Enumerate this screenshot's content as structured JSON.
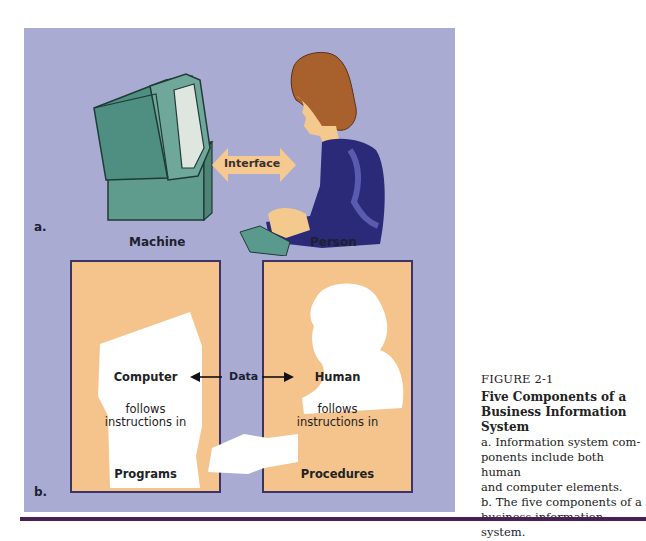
{
  "figure": {
    "number": "FIGURE 2-1",
    "title": "Five Components of a Business Information System",
    "caption_a": "a. Information system components include both human and computer elements.",
    "caption_b": "b. The five components of a business information system.",
    "caption_lines": [
      "a. Information system com-",
      "ponents include both human",
      "and computer elements.",
      "b. The five components of a",
      "business information system."
    ]
  },
  "part_a": {
    "label": "a.",
    "interface_label": "Interface",
    "machine_label": "Machine",
    "person_label": "Person"
  },
  "part_b": {
    "label": "b.",
    "data_label": "Data",
    "left_box": {
      "heading": "Computer",
      "line1": "follows",
      "line2": "instructions in",
      "footer": "Programs"
    },
    "right_box": {
      "heading": "Human",
      "line1": "follows",
      "line2": "instructions in",
      "footer": "Procedures"
    }
  },
  "colors": {
    "panel_bg": "#a9abd2",
    "box_fill": "#f4c48c",
    "box_border": "#3d3466",
    "rule": "#4a1f55",
    "computer_green": "#4f8f82",
    "sweater": "#2a2a78",
    "hair": "#a8602c"
  }
}
